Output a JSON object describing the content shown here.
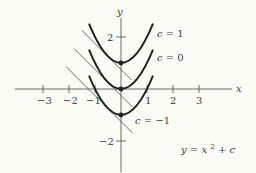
{
  "figure": {
    "formula_label": {
      "lhs": "y",
      "eq": "= ",
      "x": "x",
      "exp": "2",
      "rest": " + c"
    },
    "axes": {
      "x_label": "x",
      "y_label": "y",
      "x_ticks": [
        {
          "value": -3,
          "label": "−3"
        },
        {
          "value": -2,
          "label": "−2"
        },
        {
          "value": -1,
          "label": "−1"
        },
        {
          "value": 1,
          "label": "1"
        },
        {
          "value": 2,
          "label": "2"
        },
        {
          "value": 3,
          "label": "3"
        }
      ],
      "y_ticks": [
        {
          "value": 2,
          "label": "2"
        },
        {
          "value": -2,
          "label": "−2"
        }
      ]
    },
    "curves": [
      {
        "c": 1,
        "label": "c = 1"
      },
      {
        "c": 0,
        "label": "c = 0"
      },
      {
        "c": -1,
        "label": "c = −1"
      }
    ],
    "tangent_point_x": -0.5,
    "colors": {
      "curve": "#222222",
      "axis": "#555555",
      "tangent": "#444444",
      "background": "#fdfdf8"
    }
  }
}
